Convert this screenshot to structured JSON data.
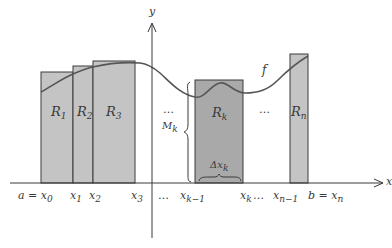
{
  "diagram": {
    "type": "riemann-upper-sum",
    "colors": {
      "background": "#ffffff",
      "rect_fill": "#c4c4c4",
      "rect_fill_dark": "#a9a9a9",
      "stroke": "#3a3a3a",
      "curve": "#555555"
    },
    "axes": {
      "x_label": "x",
      "y_label": "y"
    },
    "function_label": "f",
    "rectangles": [
      {
        "id": "R1",
        "label_main": "R",
        "label_sub": "1"
      },
      {
        "id": "R2",
        "label_main": "R",
        "label_sub": "2"
      },
      {
        "id": "R3",
        "label_main": "R",
        "label_sub": "3"
      },
      {
        "id": "Rk",
        "label_main": "R",
        "label_sub": "k"
      },
      {
        "id": "Rn",
        "label_main": "R",
        "label_sub": "n"
      }
    ],
    "height_label": {
      "main": "M",
      "sub": "k"
    },
    "width_label": {
      "main": "Δx",
      "sub": "k"
    },
    "ellipsis": "…",
    "tick_labels": [
      {
        "main": "a = x",
        "sub": "0"
      },
      {
        "main": "x",
        "sub": "1"
      },
      {
        "main": "x",
        "sub": "2"
      },
      {
        "main": "x",
        "sub": "3"
      },
      {
        "main": "x",
        "sub": "k−1"
      },
      {
        "main": "x",
        "sub": "k"
      },
      {
        "main": "x",
        "sub": "n−1"
      },
      {
        "main": "b = x",
        "sub": "n"
      }
    ]
  }
}
